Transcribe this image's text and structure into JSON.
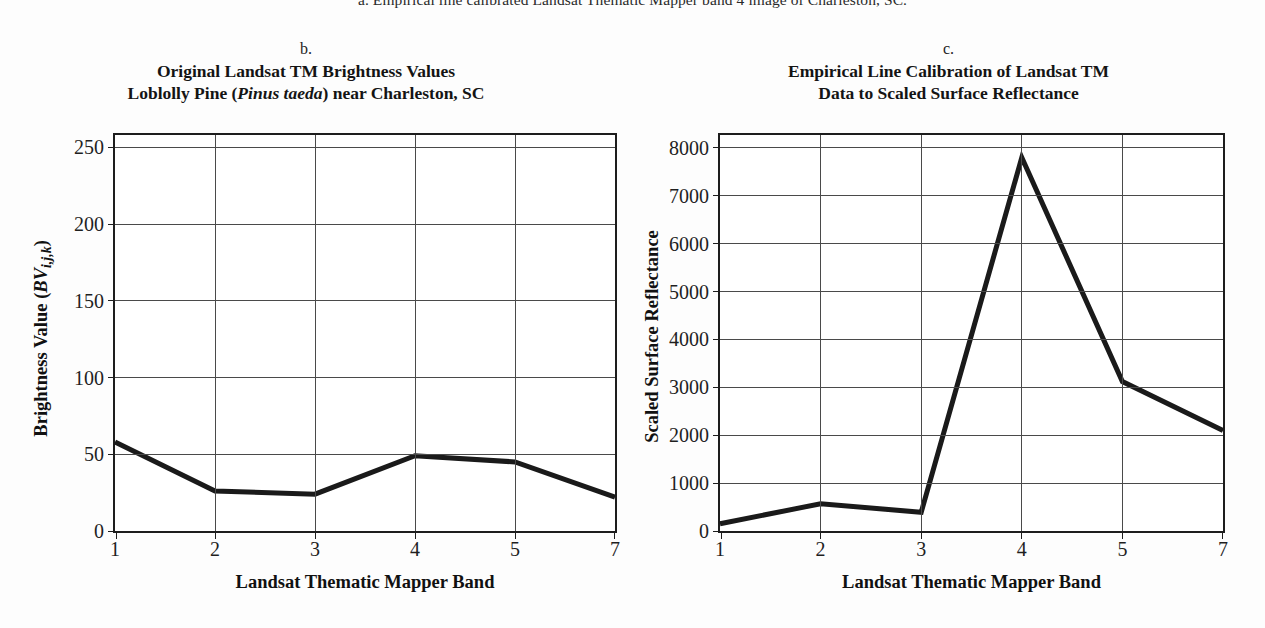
{
  "figure": {
    "caption_a": "a. Empirical line calibrated Landsat Thematic Mapper band 4 image of Charleston, SC.",
    "panels": [
      {
        "letter": "b.",
        "title_line1": "Original Landsat TM Brightness Values",
        "title_line2_pre": "Loblolly Pine (",
        "title_line2_sci": "Pinus taeda",
        "title_line2_post": ") near Charleston, SC"
      },
      {
        "letter": "c.",
        "title_line1": "Empirical Line Calibration of Landsat TM",
        "title_line2_pre": "Data to Scaled Surface Reflectance",
        "title_line2_sci": "",
        "title_line2_post": ""
      }
    ]
  },
  "axis_titles": {
    "x_shared": "Landsat Thematic Mapper Band",
    "y_b_pre": "Brightness Value (",
    "y_b_sym": "BV",
    "y_b_sub": "i,j,k",
    "y_b_post": ")",
    "y_c": "Scaled Surface Reflectance"
  },
  "chart_data": [
    {
      "type": "line",
      "id": "panel-b",
      "title": "Original Landsat TM Brightness Values Loblolly Pine (Pinus taeda) near Charleston, SC",
      "xlabel": "Landsat Thematic Mapper Band",
      "ylabel": "Brightness Value (BVi,j,k)",
      "categories": [
        "1",
        "2",
        "3",
        "4",
        "5",
        "7"
      ],
      "values": [
        58,
        26,
        24,
        49,
        45,
        22
      ],
      "ylim": [
        0,
        258
      ],
      "yticks": [
        0,
        50,
        100,
        150,
        200,
        250
      ],
      "ytick_labels": [
        "0",
        "50",
        "100",
        "150",
        "200",
        "250"
      ],
      "grid": true,
      "legend": "none",
      "line_color": "#1a1a1a"
    },
    {
      "type": "line",
      "id": "panel-c",
      "title": "Empirical Line Calibration of Landsat TM Data to Scaled Surface Reflectance",
      "xlabel": "Landsat Thematic Mapper Band",
      "ylabel": "Scaled Surface Reflectance",
      "categories": [
        "1",
        "2",
        "3",
        "4",
        "5",
        "7"
      ],
      "values": [
        150,
        570,
        390,
        7800,
        3120,
        2100
      ],
      "ylim": [
        0,
        8270
      ],
      "yticks": [
        0,
        1000,
        2000,
        3000,
        4000,
        5000,
        6000,
        7000,
        8000
      ],
      "ytick_labels": [
        "0",
        "1000",
        "2000",
        "3000",
        "4000",
        "5000",
        "6000",
        "7000",
        "8000"
      ],
      "grid": true,
      "legend": "none",
      "line_color": "#1a1a1a"
    }
  ]
}
